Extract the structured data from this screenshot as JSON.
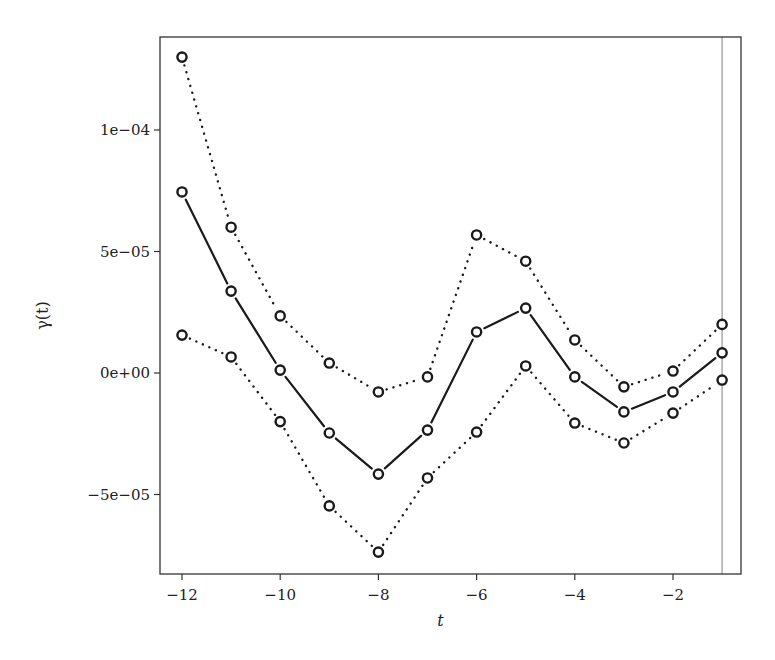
{
  "chart_data": {
    "type": "line",
    "title": "",
    "xlabel": "t",
    "ylabel": "γ(t)",
    "x": [
      -12,
      -11,
      -10,
      -9,
      -8,
      -7,
      -6,
      -5,
      -4,
      -3,
      -2,
      -1
    ],
    "xlim": [
      -12.3,
      -0.6
    ],
    "ylim": [
      -8.2e-05,
      0.000138
    ],
    "xticks": [
      -12,
      -10,
      -8,
      -6,
      -4,
      -2
    ],
    "xtick_labels": [
      "−12",
      "−10",
      "−8",
      "−6",
      "−4",
      "−2"
    ],
    "yticks": [
      0.0001,
      5e-05,
      0,
      -5e-05
    ],
    "ytick_labels": [
      "1e−04",
      "5e−05",
      "0e+00",
      "−5e−05"
    ],
    "grid": false,
    "legend": null,
    "series": [
      {
        "name": "estimate",
        "style": "solid",
        "marker": "open-circle",
        "values": [
          7.45e-05,
          3.37e-05,
          1.2e-06,
          -2.47e-05,
          -4.16e-05,
          -2.35e-05,
          1.69e-05,
          2.67e-05,
          -1.6e-06,
          -1.6e-05,
          -7.8e-06,
          8.3e-06
        ]
      },
      {
        "name": "upper bound",
        "style": "dotted",
        "marker": "open-circle",
        "values": [
          0.00013,
          6e-05,
          2.35e-05,
          4.1e-06,
          -7.8e-06,
          -1.6e-06,
          5.68e-05,
          4.6e-05,
          1.36e-05,
          -5.7e-06,
          8e-07,
          2e-05
        ]
      },
      {
        "name": "lower bound",
        "style": "dotted",
        "marker": "open-circle",
        "values": [
          1.56e-05,
          6.6e-06,
          -2e-05,
          -5.47e-05,
          -7.37e-05,
          -4.32e-05,
          -2.43e-05,
          2.9e-06,
          -2.06e-05,
          -2.88e-05,
          -1.65e-05,
          -2.9e-06
        ]
      }
    ],
    "annotations": [
      {
        "type": "vertical-line",
        "x": -1,
        "color": "#b0b0b0"
      }
    ]
  },
  "colors": {
    "series": "#1a1a1a",
    "axis": "#333333",
    "reference_line": "#b0b0b0"
  }
}
